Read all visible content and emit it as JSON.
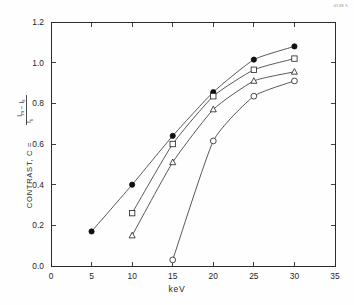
{
  "figure": {
    "corner_code": "4138 5"
  },
  "chart_data": {
    "type": "line",
    "title": "",
    "xlabel": "keV",
    "ylabel": "CONTRAST, C =",
    "ylabel_fraction": {
      "numerator": "I_m - I_s",
      "numerator_parts": [
        "I",
        "m",
        " − ",
        "I",
        "s"
      ],
      "denominator": "I_s",
      "denominator_parts": [
        "I",
        "s"
      ]
    },
    "xlim": [
      0,
      35
    ],
    "ylim": [
      0.0,
      1.2
    ],
    "xticks": [
      0,
      5,
      10,
      15,
      20,
      25,
      30,
      35
    ],
    "xticklabels": [
      "0",
      "5",
      "10",
      "15",
      "20",
      "25",
      "30",
      "35"
    ],
    "yticks": [
      0.0,
      0.2,
      0.4,
      0.6,
      0.8,
      1.0,
      1.2
    ],
    "yticklabels": [
      "0.0",
      "0.2",
      "0.4",
      "0.6",
      "0.8",
      "1.0",
      "1.2"
    ],
    "grid": false,
    "legend": "none",
    "frame": "box",
    "tick_direction": "in",
    "series": [
      {
        "name": "series-filled-circle",
        "marker": "filled-circle",
        "x": [
          5,
          10,
          15,
          20,
          25,
          30
        ],
        "values": [
          0.17,
          0.4,
          0.64,
          0.855,
          1.015,
          1.08
        ]
      },
      {
        "name": "series-open-square",
        "marker": "open-square",
        "x": [
          10,
          15,
          20,
          25,
          30
        ],
        "values": [
          0.26,
          0.6,
          0.835,
          0.965,
          1.02
        ]
      },
      {
        "name": "series-open-triangle",
        "marker": "open-triangle",
        "x": [
          10,
          15,
          20,
          25,
          30
        ],
        "values": [
          0.15,
          0.51,
          0.77,
          0.91,
          0.955
        ]
      },
      {
        "name": "series-open-circle",
        "marker": "open-circle",
        "x": [
          15,
          20,
          25,
          30
        ],
        "values": [
          0.03,
          0.615,
          0.835,
          0.91
        ]
      }
    ]
  }
}
